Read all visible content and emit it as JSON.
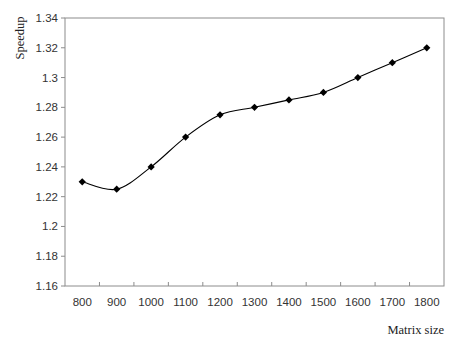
{
  "chart_data": {
    "type": "line",
    "title": "",
    "xlabel": "Matrix size",
    "ylabel": "Speedup",
    "categories": [
      "800",
      "900",
      "1000",
      "1100",
      "1200",
      "1300",
      "1400",
      "1500",
      "1600",
      "1700",
      "1800"
    ],
    "series": [
      {
        "name": "Speedup",
        "values": [
          1.23,
          1.225,
          1.24,
          1.26,
          1.275,
          1.28,
          1.285,
          1.29,
          1.3,
          1.31,
          1.32
        ],
        "marker": "diamond",
        "smooth": true,
        "color": "#000000"
      }
    ],
    "ylim": [
      1.16,
      1.34
    ],
    "yticks": [
      "1.16",
      "1.18",
      "1.2",
      "1.22",
      "1.24",
      "1.26",
      "1.28",
      "1.3",
      "1.32",
      "1.34"
    ],
    "grid": false,
    "legend": "none"
  },
  "colors": {
    "frame": "#8c8c8c",
    "line": "#000000"
  }
}
